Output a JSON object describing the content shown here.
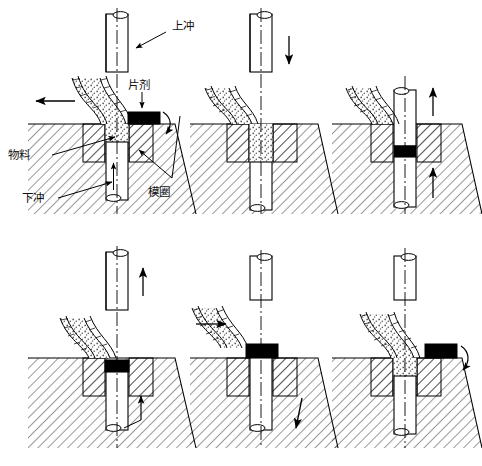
{
  "figure": {
    "background_color": "#ffffff",
    "line_color": "#000000",
    "tablet_color": "#000000",
    "granule_color": "#9a9a9a",
    "panel_count": 6,
    "rows": 2,
    "columns": 3
  },
  "labels": {
    "upper_punch": "上冲",
    "tablet": "片剂",
    "material": "物料",
    "lower_punch": "下冲",
    "die_ring": "模圈"
  },
  "panels": [
    {
      "id": "panel-1",
      "step": 1,
      "name": "feed-filling",
      "upper_punch_state": "raised",
      "lower_punch_state": "lowered",
      "hopper_visible": true,
      "hopper_motion": "left",
      "tablet_present": true,
      "tablet_position": "on-die-table-right",
      "cavity_fill": "granules",
      "arrows": [
        "hopper-left",
        "tablet-sweep-right",
        "material-into-cavity",
        "lower-punch-up"
      ]
    },
    {
      "id": "panel-2",
      "step": 2,
      "name": "punch-descending",
      "upper_punch_state": "descending",
      "lower_punch_state": "lowered",
      "hopper_visible": true,
      "hopper_motion": "retracted",
      "tablet_present": false,
      "tablet_position": "none",
      "cavity_fill": "granules",
      "arrows": [
        "upper-punch-down"
      ]
    },
    {
      "id": "panel-3",
      "step": 3,
      "name": "compression",
      "upper_punch_state": "inserted",
      "lower_punch_state": "raised",
      "hopper_visible": true,
      "hopper_motion": "retracted",
      "tablet_present": true,
      "tablet_position": "in-die-bore",
      "cavity_fill": "compressed",
      "arrows": [
        "upper-punch-up",
        "lower-punch-up"
      ]
    },
    {
      "id": "panel-4",
      "step": 4,
      "name": "upper-punch-withdraw",
      "upper_punch_state": "raised",
      "lower_punch_state": "rising",
      "hopper_visible": true,
      "hopper_motion": "retracted",
      "tablet_present": true,
      "tablet_position": "in-die-top",
      "cavity_fill": "compressed",
      "arrows": [
        "upper-punch-up",
        "lower-punch-up"
      ]
    },
    {
      "id": "panel-5",
      "step": 5,
      "name": "ejection",
      "upper_punch_state": "raised",
      "lower_punch_state": "top-flush",
      "hopper_visible": true,
      "hopper_motion": "right",
      "tablet_present": true,
      "tablet_position": "ejected-on-table",
      "cavity_fill": "empty",
      "arrows": [
        "hopper-right",
        "lower-punch-down"
      ]
    },
    {
      "id": "panel-6",
      "step": 6,
      "name": "sweep-and-refill",
      "upper_punch_state": "raised",
      "lower_punch_state": "lowered",
      "hopper_visible": true,
      "hopper_motion": "over-die",
      "tablet_present": true,
      "tablet_position": "swept-right",
      "cavity_fill": "granules",
      "arrows": [
        "tablet-sweep-right"
      ]
    }
  ]
}
